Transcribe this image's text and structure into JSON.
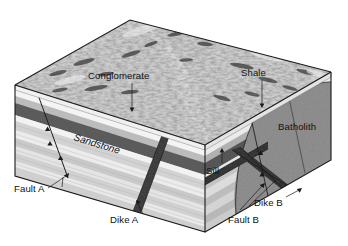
{
  "figure": {
    "type": "geologic-block-diagram",
    "title": "",
    "background_color": "#ffffff"
  },
  "labels": {
    "conglomerate": "Conglomerate",
    "shale": "Shale",
    "sandstone": "Sandstone",
    "batholith": "Batholith",
    "sill": "Sill",
    "dike_a": "Dike A",
    "dike_b": "Dike B",
    "fault_a": "Fault A",
    "fault_b": "Fault B"
  },
  "colors": {
    "outline": "#1a1a1a",
    "text": "#111111",
    "terrain_light": "#d9d9d9",
    "terrain_mid": "#a8a8a8",
    "terrain_dark": "#4a4a4a",
    "shale_band": "#5e5e5e",
    "conglomerate_band": "#6a6a6a",
    "sandstone_light": "#e2e2e2",
    "sandstone_mid": "#c6c6c6",
    "sandstone_pale": "#efefef",
    "batholith": "#868686",
    "dike": "#3a3a3a",
    "sill": "#3a3a3a",
    "side_shadow": "#b5b5b5"
  },
  "units": [
    {
      "name": "Conglomerate",
      "position": "top-surface",
      "tone": "mottled-gray"
    },
    {
      "name": "Shale",
      "position": "upper-band",
      "tone": "dark-gray"
    },
    {
      "name": "Sandstone",
      "position": "mid-lower-beds",
      "tone": "light-gray-banded"
    },
    {
      "name": "Batholith",
      "position": "right-rear-mass",
      "tone": "medium-gray-speckled"
    },
    {
      "name": "Sill",
      "position": "concordant-intrusion",
      "tone": "near-black"
    },
    {
      "name": "Dike A",
      "position": "left-front-face",
      "tone": "near-black"
    },
    {
      "name": "Dike B",
      "position": "right-front-face",
      "tone": "near-black"
    }
  ],
  "structures": [
    {
      "name": "Fault A",
      "type": "normal-fault",
      "face": "left-front"
    },
    {
      "name": "Fault B",
      "type": "normal-fault",
      "face": "right-front"
    },
    {
      "name": "Dike A",
      "type": "discordant-intrusion",
      "face": "left-front"
    },
    {
      "name": "Dike B",
      "type": "discordant-intrusion",
      "face": "right-front"
    }
  ]
}
